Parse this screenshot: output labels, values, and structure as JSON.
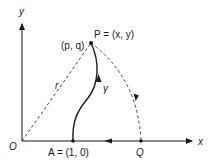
{
  "diagram": {
    "axes": {
      "x_label": "x",
      "y_label": "y",
      "origin_label": "O"
    },
    "points": {
      "P": {
        "label": "P = (x, y)",
        "alt_label": "(p, q)"
      },
      "A": {
        "label": "A = (1, 0)"
      },
      "Q": {
        "label": "Q"
      }
    },
    "segments": {
      "radius_label": "r",
      "curve_label": "γ"
    },
    "colors": {
      "stroke": "#1a1a1a",
      "background": "#ffffff"
    }
  }
}
